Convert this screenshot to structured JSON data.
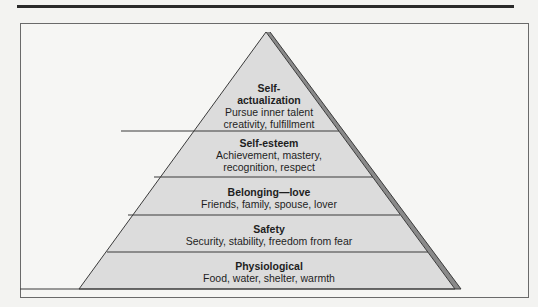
{
  "diagram": {
    "type": "pyramid",
    "colors": {
      "fill": "#dcdcdc",
      "shadow": "#8a8a8a",
      "line": "#3a3a3a",
      "frame": "#6a6a6a"
    },
    "levels": [
      {
        "title_line1": "Self-",
        "title_line2": "actualization",
        "desc_line1": "Pursue inner talent",
        "desc_line2": "creativity, fulfillment"
      },
      {
        "title": "Self-esteem",
        "desc_line1": "Achievement, mastery,",
        "desc_line2": "recognition, respect"
      },
      {
        "title": "Belonging—love",
        "desc": "Friends, family, spouse, lover"
      },
      {
        "title": "Safety",
        "desc": "Security, stability, freedom from fear"
      },
      {
        "title": "Physiological",
        "desc": "Food, water, shelter, warmth"
      }
    ]
  }
}
